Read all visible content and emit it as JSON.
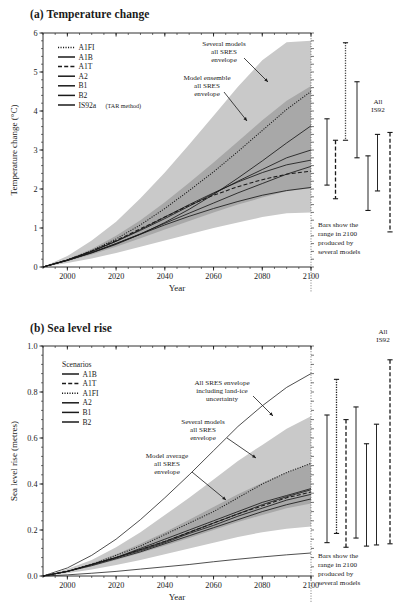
{
  "figure": {
    "panel_a_title": "(a) Temperature change",
    "panel_b_title": "(b) Sea level rise"
  },
  "panel_a": {
    "ylabel": "Temperature change (°C)",
    "xlabel": "Year",
    "yticks": [
      "0",
      "1",
      "2",
      "3",
      "4",
      "5",
      "6"
    ],
    "xticks": [
      "2000",
      "2020",
      "2040",
      "2060",
      "2080",
      "2100"
    ],
    "legend": {
      "items": [
        {
          "label": "A1FI",
          "style": "dotted"
        },
        {
          "label": "A1B",
          "style": "solid"
        },
        {
          "label": "A1T",
          "style": "dashed"
        },
        {
          "label": "A2",
          "style": "solid"
        },
        {
          "label": "B1",
          "style": "solid"
        },
        {
          "label": "B2",
          "style": "solid"
        },
        {
          "label": "IS92a",
          "suffix": "(TAR method)",
          "style": "solid"
        }
      ]
    },
    "annotations": [
      {
        "name": "several-models-envelope",
        "lines": [
          "Several models",
          "all SRES",
          "envelope"
        ]
      },
      {
        "name": "model-ensemble-envelope",
        "lines": [
          "Model ensemble",
          "all SRES",
          "envelope"
        ]
      }
    ],
    "bars_label": [
      "All",
      "IS92"
    ],
    "caption": [
      "Bars show the",
      "range in 2100",
      "produced by",
      "several models"
    ]
  },
  "panel_b": {
    "ylabel": "Sea level rise (metres)",
    "xlabel": "Year",
    "yticks": [
      "0.0",
      "0.2",
      "0.4",
      "0.6",
      "0.8",
      "1.0"
    ],
    "xticks": [
      "2000",
      "2020",
      "2040",
      "2060",
      "2080",
      "2100"
    ],
    "legend": {
      "header": "Scenarios",
      "items": [
        {
          "label": "A1B",
          "style": "solid"
        },
        {
          "label": "A1T",
          "style": "dashed"
        },
        {
          "label": "A1FI",
          "style": "dotted"
        },
        {
          "label": "A2",
          "style": "solid"
        },
        {
          "label": "B1",
          "style": "solid"
        },
        {
          "label": "B2",
          "style": "solid"
        }
      ]
    },
    "annotations": [
      {
        "name": "all-sres-land-ice",
        "lines": [
          "All SRES envelope",
          "including land-ice",
          "uncertainty"
        ]
      },
      {
        "name": "several-models-envelope",
        "lines": [
          "Several models",
          "all SRES",
          "envelope"
        ]
      },
      {
        "name": "model-average-envelope",
        "lines": [
          "Model average",
          "all SRES",
          "envelope"
        ]
      }
    ],
    "bars_label": [
      "All",
      "IS92"
    ],
    "caption": [
      "Bars show the",
      "range in 2100",
      "produced by",
      "several models"
    ]
  },
  "chart_data": [
    {
      "type": "line",
      "name": "temperature-change",
      "title": "(a) Temperature change",
      "xlabel": "Year",
      "ylabel": "Temperature change (°C)",
      "xlim": [
        1990,
        2100
      ],
      "ylim": [
        0,
        6
      ],
      "xticks": [
        2000,
        2020,
        2040,
        2060,
        2080,
        2100
      ],
      "yticks": [
        0,
        1,
        2,
        3,
        4,
        5,
        6
      ],
      "grid": false,
      "legend_position": "top-left",
      "x": [
        1990,
        2000,
        2010,
        2020,
        2030,
        2040,
        2050,
        2060,
        2070,
        2080,
        2090,
        2100
      ],
      "series": [
        {
          "name": "A1FI",
          "style": "dotted",
          "values": [
            0.0,
            0.18,
            0.42,
            0.72,
            1.08,
            1.5,
            1.96,
            2.44,
            2.96,
            3.5,
            4.04,
            4.5
          ]
        },
        {
          "name": "A1B",
          "style": "solid",
          "values": [
            0.0,
            0.18,
            0.4,
            0.66,
            0.96,
            1.28,
            1.6,
            1.9,
            2.18,
            2.42,
            2.62,
            2.74
          ]
        },
        {
          "name": "A1T",
          "style": "dashed",
          "values": [
            0.0,
            0.18,
            0.41,
            0.68,
            0.98,
            1.28,
            1.58,
            1.84,
            2.06,
            2.24,
            2.38,
            2.46
          ]
        },
        {
          "name": "A2",
          "style": "solid",
          "values": [
            0.0,
            0.17,
            0.36,
            0.58,
            0.84,
            1.14,
            1.48,
            1.86,
            2.28,
            2.72,
            3.18,
            3.62
          ]
        },
        {
          "name": "B1",
          "style": "solid",
          "values": [
            0.0,
            0.17,
            0.37,
            0.6,
            0.84,
            1.08,
            1.3,
            1.5,
            1.68,
            1.84,
            1.96,
            2.04
          ]
        },
        {
          "name": "B2",
          "style": "solid",
          "values": [
            0.0,
            0.17,
            0.37,
            0.6,
            0.85,
            1.12,
            1.38,
            1.64,
            1.9,
            2.14,
            2.38,
            2.58
          ]
        },
        {
          "name": "IS92a (TAR method)",
          "style": "solid",
          "values": [
            0.0,
            0.18,
            0.4,
            0.66,
            0.94,
            1.24,
            1.56,
            1.88,
            2.2,
            2.5,
            2.8,
            3.0
          ]
        }
      ],
      "bands": [
        {
          "name": "several models all SRES envelope",
          "shade": "light",
          "upper": [
            0.0,
            0.28,
            0.68,
            1.16,
            1.76,
            2.42,
            3.14,
            3.88,
            4.62,
            5.3,
            5.76,
            5.8
          ],
          "lower": [
            0.0,
            0.1,
            0.22,
            0.36,
            0.52,
            0.68,
            0.84,
            1.0,
            1.14,
            1.28,
            1.38,
            1.4
          ]
        },
        {
          "name": "model ensemble all SRES envelope",
          "shade": "dark",
          "upper": [
            0.0,
            0.2,
            0.46,
            0.8,
            1.2,
            1.66,
            2.16,
            2.68,
            3.22,
            3.76,
            4.26,
            4.64
          ],
          "lower": [
            0.0,
            0.15,
            0.32,
            0.52,
            0.74,
            0.96,
            1.18,
            1.4,
            1.6,
            1.78,
            1.94,
            2.02
          ]
        }
      ],
      "bars": [
        {
          "name": "A1B",
          "style": "solid",
          "low": 2.1,
          "high": 3.8
        },
        {
          "name": "A1T",
          "style": "dashed",
          "low": 1.75,
          "high": 3.25
        },
        {
          "name": "A1FI",
          "style": "dotted",
          "low": 3.25,
          "high": 5.75
        },
        {
          "name": "A2",
          "style": "solid",
          "low": 2.8,
          "high": 4.75
        },
        {
          "name": "B1",
          "style": "solid",
          "low": 1.45,
          "high": 2.85
        },
        {
          "name": "B2",
          "style": "solid",
          "low": 1.95,
          "high": 3.4
        },
        {
          "name": "All IS92",
          "style": "dashed",
          "low": 0.9,
          "high": 3.45
        }
      ]
    },
    {
      "type": "line",
      "name": "sea-level-rise",
      "title": "(b) Sea level rise",
      "xlabel": "Year",
      "ylabel": "Sea level rise (metres)",
      "xlim": [
        1990,
        2100
      ],
      "ylim": [
        0.0,
        1.0
      ],
      "xticks": [
        2000,
        2020,
        2040,
        2060,
        2080,
        2100
      ],
      "yticks": [
        0.0,
        0.2,
        0.4,
        0.6,
        0.8,
        1.0
      ],
      "grid": false,
      "legend_position": "top-left",
      "x": [
        1990,
        2000,
        2010,
        2020,
        2030,
        2040,
        2050,
        2060,
        2070,
        2080,
        2090,
        2100
      ],
      "series": [
        {
          "name": "A1B",
          "style": "solid",
          "values": [
            0.0,
            0.02,
            0.05,
            0.08,
            0.12,
            0.16,
            0.2,
            0.24,
            0.28,
            0.32,
            0.35,
            0.38
          ]
        },
        {
          "name": "A1T",
          "style": "dashed",
          "values": [
            0.0,
            0.02,
            0.05,
            0.08,
            0.115,
            0.15,
            0.19,
            0.23,
            0.27,
            0.305,
            0.34,
            0.365
          ]
        },
        {
          "name": "A1FI",
          "style": "dotted",
          "values": [
            0.0,
            0.02,
            0.05,
            0.09,
            0.13,
            0.18,
            0.23,
            0.28,
            0.34,
            0.4,
            0.45,
            0.49
          ]
        },
        {
          "name": "A2",
          "style": "solid",
          "values": [
            0.0,
            0.02,
            0.05,
            0.08,
            0.115,
            0.15,
            0.19,
            0.23,
            0.27,
            0.31,
            0.345,
            0.375
          ]
        },
        {
          "name": "B1",
          "style": "solid",
          "values": [
            0.0,
            0.02,
            0.045,
            0.075,
            0.105,
            0.14,
            0.175,
            0.21,
            0.245,
            0.28,
            0.31,
            0.335
          ]
        },
        {
          "name": "B2",
          "style": "solid",
          "values": [
            0.0,
            0.02,
            0.05,
            0.08,
            0.11,
            0.145,
            0.185,
            0.22,
            0.26,
            0.295,
            0.33,
            0.355
          ]
        }
      ],
      "bands": [
        {
          "name": "all SRES envelope including land-ice uncertainty",
          "shade": "outline",
          "upper": [
            0.0,
            0.035,
            0.09,
            0.16,
            0.245,
            0.34,
            0.44,
            0.545,
            0.65,
            0.74,
            0.82,
            0.88
          ],
          "lower": [
            0.0,
            0.005,
            0.012,
            0.02,
            0.03,
            0.04,
            0.05,
            0.062,
            0.073,
            0.083,
            0.092,
            0.1
          ]
        },
        {
          "name": "several models all SRES envelope",
          "shade": "light",
          "upper": [
            0.0,
            0.03,
            0.07,
            0.125,
            0.19,
            0.265,
            0.34,
            0.42,
            0.5,
            0.57,
            0.64,
            0.695
          ],
          "lower": [
            0.0,
            0.012,
            0.028,
            0.048,
            0.07,
            0.095,
            0.12,
            0.145,
            0.17,
            0.19,
            0.205,
            0.215
          ]
        },
        {
          "name": "model average all SRES envelope",
          "shade": "dark",
          "upper": [
            0.0,
            0.022,
            0.055,
            0.095,
            0.14,
            0.19,
            0.245,
            0.3,
            0.355,
            0.405,
            0.45,
            0.49
          ],
          "lower": [
            0.0,
            0.018,
            0.042,
            0.07,
            0.1,
            0.132,
            0.165,
            0.2,
            0.235,
            0.265,
            0.295,
            0.315
          ]
        }
      ],
      "bars": [
        {
          "name": "A1B",
          "style": "solid",
          "low": 0.145,
          "high": 0.7
        },
        {
          "name": "A1T",
          "style": "dotted",
          "low": 0.185,
          "high": 0.855
        },
        {
          "name": "A1FI",
          "style": "dashed",
          "low": 0.125,
          "high": 0.68
        },
        {
          "name": "A2",
          "style": "solid",
          "low": 0.165,
          "high": 0.735
        },
        {
          "name": "B1",
          "style": "solid",
          "low": 0.13,
          "high": 0.575
        },
        {
          "name": "B2",
          "style": "solid",
          "low": 0.135,
          "high": 0.66
        },
        {
          "name": "All IS92",
          "style": "dashed",
          "low": 0.14,
          "high": 0.94
        }
      ]
    }
  ]
}
